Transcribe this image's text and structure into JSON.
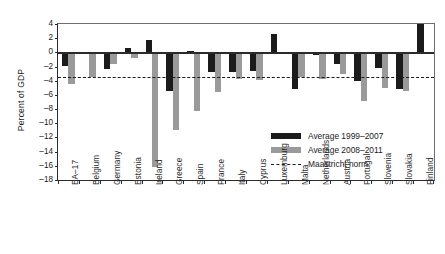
{
  "chart_data": {
    "type": "bar",
    "title": "",
    "xlabel": "",
    "ylabel": "Percent of GDP",
    "ylim": [
      -18,
      4
    ],
    "ytick_step": 2,
    "yticks": [
      "4",
      "2",
      "0",
      "-2",
      "-4",
      "-6",
      "-8",
      "-10",
      "-12",
      "-14",
      "-16",
      "-18"
    ],
    "grid": false,
    "legend_position": "inside-lower-right",
    "categories": [
      "EA-17",
      "Belgium",
      "Germany",
      "Estonia",
      "Ireland",
      "Greece",
      "Spain",
      "France",
      "Italy",
      "Cyprus",
      "Luxemburg",
      "Malta",
      "Netherlands",
      "Austria",
      "Portugal",
      "Slovenia",
      "Slovakia",
      "Finland"
    ],
    "series": [
      {
        "name": "Average 1999-2007",
        "color": "#1b1b1b",
        "values": [
          -1.9,
          -0.3,
          -2.3,
          0.6,
          1.7,
          -5.5,
          0.2,
          -2.7,
          -2.8,
          -2.6,
          2.6,
          -5.1,
          -0.4,
          -1.7,
          -4.0,
          -2.2,
          -5.1,
          4.0
        ]
      },
      {
        "name": "Average 2008-2011",
        "color": "#9a9a9a",
        "values": [
          -4.5,
          -3.5,
          -1.7,
          -0.8,
          -16.2,
          -11.0,
          -8.3,
          -5.6,
          -3.8,
          -3.9,
          -0.2,
          -3.5,
          -3.7,
          -3.0,
          -6.8,
          -5.0,
          -5.5,
          -0.1
        ]
      }
    ],
    "reference_line": {
      "name": "Maastricht norm",
      "value": -3.5,
      "style": "dashed",
      "color": "#1a1a1a"
    }
  },
  "legend": {
    "items": [
      {
        "label": "Average 1999-2007",
        "swatch": "solid-black"
      },
      {
        "label": "Average 2008-2011",
        "swatch": "solid-gray"
      },
      {
        "label": "Maastricht norm",
        "swatch": "dashed-line"
      }
    ]
  }
}
